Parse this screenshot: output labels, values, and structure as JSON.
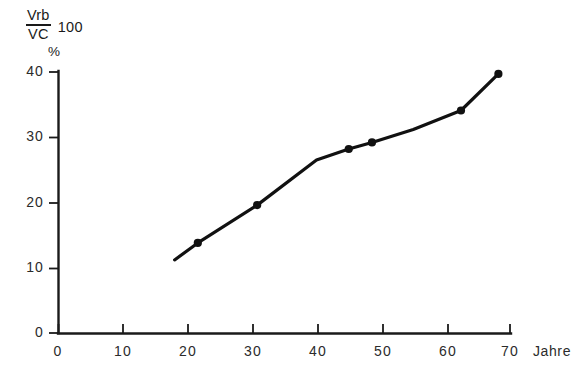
{
  "chart_data": {
    "type": "line",
    "title": "",
    "subtitle": "",
    "xlabel": "Jahre",
    "ylabel": "Vrb/VC 100 %",
    "ylabel_parts": {
      "numerator": "Vrb",
      "denominator": "VC",
      "multiplier": "100",
      "unit": "%"
    },
    "xlim": [
      0,
      70
    ],
    "ylim": [
      0,
      40
    ],
    "xticks": [
      0,
      10,
      20,
      30,
      40,
      50,
      60,
      70
    ],
    "yticks": [
      0,
      10,
      20,
      30,
      40
    ],
    "xtick_labels": [
      "0",
      "10",
      "20",
      "30",
      "40",
      "50",
      "60",
      "70"
    ],
    "ytick_labels": [
      "0",
      "10",
      "20",
      "30",
      "40"
    ],
    "grid": false,
    "legend": null,
    "legend_position": "none",
    "line_color": "#111111",
    "marker_color": "#111111",
    "axis_color": "#1a1a1a",
    "background_color": "#ffffff",
    "series": [
      {
        "name": "Vrb/VC",
        "marker": "filled-circle",
        "x": [
          18.0,
          21.6,
          30.8,
          40.0,
          45.0,
          48.6,
          55.0,
          62.4,
          68.2
        ],
        "y": [
          11.2,
          13.8,
          19.6,
          26.5,
          28.2,
          29.2,
          31.2,
          34.1,
          39.7
        ],
        "marker_points": [
          {
            "x": 21.6,
            "y": 13.8
          },
          {
            "x": 30.8,
            "y": 19.6
          },
          {
            "x": 45.0,
            "y": 28.2
          },
          {
            "x": 48.6,
            "y": 29.2
          },
          {
            "x": 62.4,
            "y": 34.1
          },
          {
            "x": 68.2,
            "y": 39.7
          }
        ]
      }
    ],
    "annotations": []
  },
  "axes": {
    "x_axis_name": "Jahre",
    "y_axis_numerator": "Vrb",
    "y_axis_denominator": "VC",
    "y_axis_multiplier": "100",
    "y_axis_unit": "%"
  },
  "ytick_labels": [
    "40",
    "30",
    "20",
    "10",
    "0"
  ],
  "xtick_labels": [
    "0",
    "10",
    "20",
    "30",
    "40",
    "50",
    "60",
    "70"
  ]
}
